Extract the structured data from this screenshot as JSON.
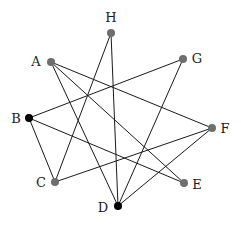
{
  "diagram": {
    "type": "graph",
    "nodes": [
      {
        "id": "A",
        "label": "A",
        "x": 51,
        "y": 62,
        "color": "#6e6e6e",
        "label_x": 36,
        "label_y": 66,
        "label_anchor": "middle"
      },
      {
        "id": "B",
        "label": "B",
        "x": 29,
        "y": 118,
        "color": "#000000",
        "label_x": 16,
        "label_y": 123,
        "label_anchor": "middle"
      },
      {
        "id": "C",
        "label": "C",
        "x": 55,
        "y": 182,
        "color": "#6e6e6e",
        "label_x": 41,
        "label_y": 187,
        "label_anchor": "middle"
      },
      {
        "id": "D",
        "label": "D",
        "x": 118,
        "y": 206,
        "color": "#000000",
        "label_x": 103,
        "label_y": 212,
        "label_anchor": "middle"
      },
      {
        "id": "E",
        "label": "E",
        "x": 184,
        "y": 183,
        "color": "#6e6e6e",
        "label_x": 197,
        "label_y": 189,
        "label_anchor": "middle"
      },
      {
        "id": "F",
        "label": "F",
        "x": 212,
        "y": 128,
        "color": "#6e6e6e",
        "label_x": 225,
        "label_y": 133,
        "label_anchor": "middle"
      },
      {
        "id": "G",
        "label": "G",
        "x": 183,
        "y": 59,
        "color": "#6e6e6e",
        "label_x": 197,
        "label_y": 63,
        "label_anchor": "middle"
      },
      {
        "id": "H",
        "label": "H",
        "x": 111,
        "y": 33,
        "color": "#6e6e6e",
        "label_x": 111,
        "label_y": 22,
        "label_anchor": "middle"
      }
    ],
    "edges": [
      [
        "A",
        "D"
      ],
      [
        "A",
        "E"
      ],
      [
        "A",
        "F"
      ],
      [
        "H",
        "C"
      ],
      [
        "H",
        "D"
      ],
      [
        "G",
        "B"
      ],
      [
        "G",
        "D"
      ],
      [
        "B",
        "C"
      ],
      [
        "B",
        "E"
      ],
      [
        "F",
        "C"
      ],
      [
        "F",
        "D"
      ]
    ],
    "node_radius": 4,
    "edge_color": "#1a1a1a"
  }
}
